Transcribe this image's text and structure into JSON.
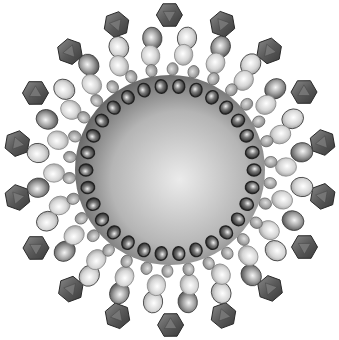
{
  "diagram": {
    "title": "",
    "center": [
      170,
      170
    ],
    "core": {
      "radius": 95,
      "color_center": "#e6e6e6",
      "color_edge": "#5a5a5a"
    },
    "rings": [
      {
        "name": "inner-dark-beads",
        "radius": 84,
        "count": 30,
        "size": 6.5,
        "fill": "#555555",
        "stroke": "#222222"
      },
      {
        "name": "small-beads",
        "radius": 101,
        "count": 30,
        "size": 6,
        "fill": "#9a9a9a",
        "stroke": "#6a6a6a"
      },
      {
        "name": "light-spheres",
        "radius": 116,
        "count": 22,
        "size": 10,
        "fill": "#d8d8d8",
        "stroke": "#8a8a8a"
      },
      {
        "name": "mixed-spheres",
        "radius": 133,
        "count": 24,
        "size": 10.5,
        "fill": "#a8a8a8",
        "stroke": "#3a3a3a"
      },
      {
        "name": "polyhedra",
        "radius": 155,
        "count": 18,
        "size": 13,
        "fill": "#6a6a6a",
        "stroke": "#2a2a2a"
      }
    ],
    "labels": []
  }
}
